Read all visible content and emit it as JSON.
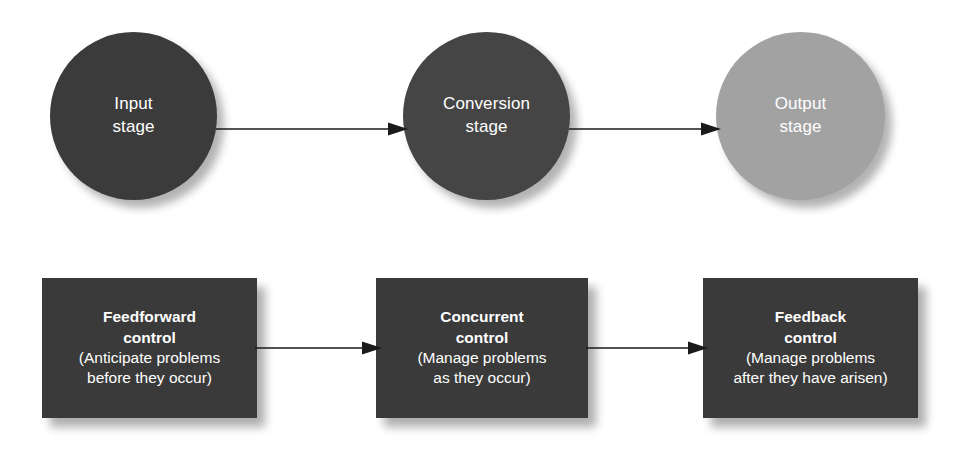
{
  "diagram": {
    "stages": [
      {
        "id": "input",
        "line1": "Input",
        "line2": "stage",
        "color": "#3b3b3b"
      },
      {
        "id": "conversion",
        "line1": "Conversion",
        "line2": "stage",
        "color": "#454545"
      },
      {
        "id": "output",
        "line1": "Output",
        "line2": "stage",
        "color": "#a2a2a2"
      }
    ],
    "controls": [
      {
        "id": "feedforward",
        "head1": "Feedforward",
        "head2": "control",
        "sub1": "(Anticipate problems",
        "sub2": "before they occur)",
        "color": "#3a3a3a"
      },
      {
        "id": "concurrent",
        "head1": "Concurrent",
        "head2": "control",
        "sub1": "(Manage problems",
        "sub2": "as they occur)",
        "color": "#3a3a3a"
      },
      {
        "id": "feedback",
        "head1": "Feedback",
        "head2": "control",
        "sub1": "(Manage problems",
        "sub2": "after they have arisen)",
        "color": "#3a3a3a"
      }
    ],
    "arrows": [
      {
        "id": "input-to-conversion",
        "icon": "arrow-right-icon"
      },
      {
        "id": "conversion-to-output",
        "icon": "arrow-right-icon"
      },
      {
        "id": "feedforward-to-concurrent",
        "icon": "arrow-right-icon"
      },
      {
        "id": "concurrent-to-feedback",
        "icon": "arrow-right-icon"
      }
    ],
    "colors": {
      "background": "#ffffff",
      "dark_fill": "#3a3a3a",
      "mid_fill": "#454545",
      "light_fill": "#a2a2a2",
      "text": "#ffffff",
      "arrow": "#1a1a1a"
    }
  }
}
